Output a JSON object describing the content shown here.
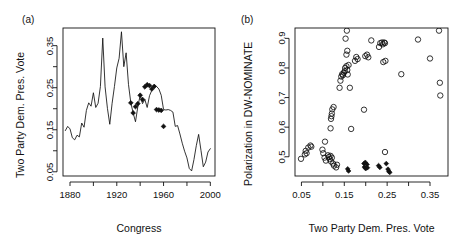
{
  "figure": {
    "background": "#ffffff",
    "foreground": "#111111"
  },
  "panels": [
    {
      "id": "a",
      "label": "(a)",
      "xlabel": "Congress",
      "ylabel": "Two Party Dem. Pres. Vote"
    },
    {
      "id": "b",
      "label": "(b)",
      "xlabel": "Two Party Dem. Pres. Vote",
      "ylabel": "Polarization in DW-NOMINATE"
    }
  ],
  "chart_data": [
    {
      "type": "line",
      "panel": "(a)",
      "title": "",
      "xlabel": "Congress",
      "ylabel": "Two Party Dem. Pres. Vote",
      "xlim": [
        1874,
        2004
      ],
      "ylim": [
        0.04,
        0.392
      ],
      "grid": false,
      "legend": null,
      "xticks": [
        1880,
        1900,
        1920,
        1940,
        1960,
        1980,
        2000
      ],
      "xtick_labels": [
        "1880",
        "",
        "1920",
        "",
        "1960",
        "",
        "2000"
      ],
      "yticks": [
        0.05,
        0.1,
        0.15,
        0.2,
        0.25,
        0.3,
        0.35
      ],
      "ytick_labels": [
        "0.05",
        "",
        "0.15",
        "",
        "0.25",
        "",
        "0.35"
      ],
      "series": [
        {
          "name": "Two Party Dem. Pres. Vote by Congress",
          "marker": "none",
          "x": [
            1876,
            1878,
            1880,
            1882,
            1884,
            1886,
            1888,
            1890,
            1892,
            1894,
            1896,
            1898,
            1900,
            1902,
            1904,
            1906,
            1908,
            1910,
            1912,
            1914,
            1916,
            1918,
            1920,
            1922,
            1924,
            1926,
            1928,
            1930,
            1932,
            1934,
            1936,
            1938,
            1940,
            1942,
            1944,
            1946,
            1948,
            1950,
            1952,
            1954,
            1956,
            1958,
            1960,
            1962,
            1964,
            1966,
            1968,
            1970,
            1972,
            1974,
            1976,
            1978,
            1980,
            1982,
            1984,
            1986,
            1988,
            1990,
            1992,
            1994,
            1996,
            1998,
            2000
          ],
          "y": [
            0.148,
            0.158,
            0.152,
            0.131,
            0.126,
            0.137,
            0.133,
            0.166,
            0.156,
            0.196,
            0.214,
            0.206,
            0.238,
            0.203,
            0.213,
            0.253,
            0.368,
            0.252,
            0.201,
            0.163,
            0.213,
            0.253,
            0.297,
            0.32,
            0.383,
            0.3,
            0.333,
            0.258,
            0.214,
            0.19,
            0.169,
            0.205,
            0.232,
            0.212,
            0.222,
            0.203,
            0.231,
            0.244,
            0.257,
            0.253,
            0.247,
            0.232,
            0.198,
            0.197,
            0.198,
            0.196,
            0.192,
            0.158,
            0.16,
            0.14,
            0.118,
            0.099,
            0.083,
            0.058,
            0.052,
            0.079,
            0.112,
            0.139,
            0.101,
            0.062,
            0.073,
            0.097,
            0.105
          ]
        },
        {
          "name": "Highlighted Congresses (filled diamonds)",
          "marker": "filled-diamond",
          "x": [
            1932,
            1934,
            1936,
            1938,
            1940,
            1942,
            1944,
            1946,
            1948,
            1950,
            1952,
            1954,
            1956,
            1958,
            1960
          ],
          "y": [
            0.214,
            0.19,
            0.205,
            0.212,
            0.232,
            0.222,
            0.252,
            0.257,
            0.255,
            0.247,
            0.253,
            0.198,
            0.197,
            0.196,
            0.158
          ]
        }
      ]
    },
    {
      "type": "scatter",
      "panel": "(b)",
      "title": "",
      "xlabel": "Two Party Dem. Pres. Vote",
      "ylabel": "Polarization in DW-NOMINATE",
      "xlim": [
        0.035,
        0.392
      ],
      "ylim": [
        0.435,
        0.935
      ],
      "grid": false,
      "legend": null,
      "xticks": [
        0.05,
        0.1,
        0.15,
        0.2,
        0.25,
        0.3,
        0.35
      ],
      "xtick_labels": [
        "0.05",
        "",
        "0.15",
        "",
        "0.25",
        "",
        "0.35"
      ],
      "yticks": [
        0.5,
        0.6,
        0.7,
        0.8,
        0.9
      ],
      "ytick_labels": [
        "0.5",
        "0.6",
        "0.7",
        "0.8",
        "0.9"
      ],
      "series": [
        {
          "name": "Congresses (open circles)",
          "marker": "open-circle",
          "points": [
            [
              0.049,
              0.493
            ],
            [
              0.058,
              0.508
            ],
            [
              0.06,
              0.52
            ],
            [
              0.062,
              0.512
            ],
            [
              0.066,
              0.531
            ],
            [
              0.071,
              0.538
            ],
            [
              0.073,
              0.534
            ],
            [
              0.099,
              0.524
            ],
            [
              0.101,
              0.512
            ],
            [
              0.104,
              0.497
            ],
            [
              0.105,
              0.551
            ],
            [
              0.107,
              0.487
            ],
            [
              0.112,
              0.505
            ],
            [
              0.114,
              0.499
            ],
            [
              0.116,
              0.492
            ],
            [
              0.118,
              0.503
            ],
            [
              0.119,
              0.484
            ],
            [
              0.121,
              0.497
            ],
            [
              0.124,
              0.477
            ],
            [
              0.126,
              0.47
            ],
            [
              0.118,
              0.596
            ],
            [
              0.119,
              0.628
            ],
            [
              0.12,
              0.637
            ],
            [
              0.121,
              0.646
            ],
            [
              0.122,
              0.66
            ],
            [
              0.125,
              0.668
            ],
            [
              0.131,
              0.464
            ],
            [
              0.133,
              0.473
            ],
            [
              0.139,
              0.733
            ],
            [
              0.141,
              0.757
            ],
            [
              0.143,
              0.771
            ],
            [
              0.145,
              0.779
            ],
            [
              0.147,
              0.776
            ],
            [
              0.149,
              0.784
            ],
            [
              0.151,
              0.789
            ],
            [
              0.152,
              0.8
            ],
            [
              0.155,
              0.806
            ],
            [
              0.157,
              0.793
            ],
            [
              0.158,
              0.778
            ],
            [
              0.16,
              0.81
            ],
            [
              0.155,
              0.845
            ],
            [
              0.157,
              0.858
            ],
            [
              0.153,
              0.899
            ],
            [
              0.156,
              0.926
            ],
            [
              0.163,
              0.733
            ],
            [
              0.166,
              0.594
            ],
            [
              0.175,
              0.824
            ],
            [
              0.178,
              0.837
            ],
            [
              0.181,
              0.83
            ],
            [
              0.196,
              0.659
            ],
            [
              0.199,
              0.84
            ],
            [
              0.203,
              0.845
            ],
            [
              0.206,
              0.836
            ],
            [
              0.213,
              0.893
            ],
            [
              0.231,
              0.871
            ],
            [
              0.234,
              0.884
            ],
            [
              0.238,
              0.886
            ],
            [
              0.24,
              0.88
            ],
            [
              0.243,
              0.886
            ],
            [
              0.245,
              0.884
            ],
            [
              0.241,
              0.82
            ],
            [
              0.246,
              0.824
            ],
            [
              0.245,
              0.516
            ],
            [
              0.283,
              0.779
            ],
            [
              0.322,
              0.896
            ],
            [
              0.35,
              0.832
            ],
            [
              0.371,
              0.926
            ],
            [
              0.373,
              0.75
            ],
            [
              0.374,
              0.707
            ]
          ]
        },
        {
          "name": "Highlighted Congresses (filled diamonds)",
          "marker": "filled-diamond",
          "points": [
            [
              0.158,
              0.459
            ],
            [
              0.16,
              0.452
            ],
            [
              0.196,
              0.477
            ],
            [
              0.199,
              0.481
            ],
            [
              0.203,
              0.474
            ],
            [
              0.197,
              0.465
            ],
            [
              0.2,
              0.46
            ],
            [
              0.204,
              0.463
            ],
            [
              0.23,
              0.47
            ],
            [
              0.233,
              0.464
            ],
            [
              0.248,
              0.477
            ],
            [
              0.252,
              0.458
            ],
            [
              0.254,
              0.451
            ],
            [
              0.256,
              0.447
            ]
          ]
        }
      ]
    }
  ]
}
